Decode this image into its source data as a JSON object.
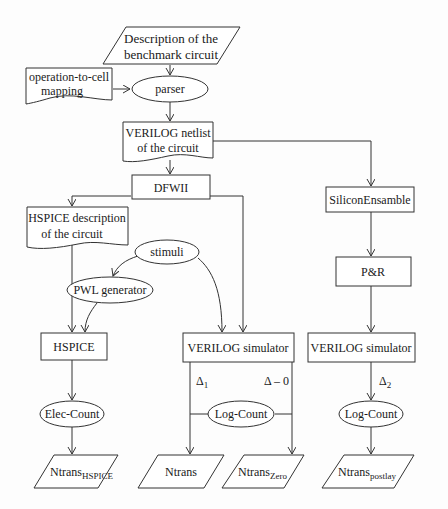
{
  "diagram": {
    "nodes": {
      "description": {
        "line1": "Description of the",
        "line2": "benchmark circuit",
        "shape": "parallelogram"
      },
      "mapping": {
        "line1": "operation-to-cell",
        "line2": "mapping",
        "shape": "document"
      },
      "parser": {
        "label": "parser",
        "shape": "ellipse"
      },
      "netlist": {
        "line1": "VERILOG netlist",
        "line2": "of the circuit",
        "shape": "document"
      },
      "dfwii": {
        "label": "DFWII",
        "shape": "rectangle"
      },
      "hspice_desc": {
        "line1": "HSPICE description",
        "line2": "of the circuit",
        "shape": "document"
      },
      "stimuli": {
        "label": "stimuli",
        "shape": "ellipse"
      },
      "pwl": {
        "label": "PWL generator",
        "shape": "ellipse"
      },
      "hspice": {
        "label": "HSPICE",
        "shape": "rectangle"
      },
      "verilog_sim_mid": {
        "label": "VERILOG simulator",
        "shape": "rectangle"
      },
      "silicon": {
        "label": "SiliconEnsamble",
        "shape": "rectangle"
      },
      "pr": {
        "label": "P&R",
        "shape": "rectangle"
      },
      "verilog_sim_right": {
        "label": "VERILOG simulator",
        "shape": "rectangle"
      },
      "elec_count": {
        "label": "Elec-Count",
        "shape": "ellipse"
      },
      "log_count_mid": {
        "label": "Log-Count",
        "shape": "ellipse"
      },
      "log_count_right": {
        "label": "Log-Count",
        "shape": "ellipse"
      },
      "out_hspice": {
        "base": "Ntrans",
        "sub": "HSPICE",
        "shape": "parallelogram"
      },
      "out_ntrans": {
        "base": "Ntrans",
        "sub": "",
        "shape": "parallelogram"
      },
      "out_zero": {
        "base": "Ntrans",
        "sub": "Zero",
        "shape": "parallelogram"
      },
      "out_postlay": {
        "base": "Ntrans",
        "sub": "postlay",
        "shape": "parallelogram"
      }
    },
    "edge_labels": {
      "delta1": {
        "base": "Δ",
        "sub": "1"
      },
      "delta0": {
        "text": "Δ – 0"
      },
      "delta2": {
        "base": "Δ",
        "sub": "2"
      }
    },
    "edges": [
      [
        "description",
        "parser"
      ],
      [
        "mapping",
        "parser"
      ],
      [
        "parser",
        "netlist"
      ],
      [
        "netlist",
        "dfwii"
      ],
      [
        "netlist",
        "silicon"
      ],
      [
        "dfwii",
        "hspice_desc"
      ],
      [
        "dfwii",
        "verilog_sim_mid"
      ],
      [
        "hspice_desc",
        "hspice"
      ],
      [
        "stimuli",
        "pwl"
      ],
      [
        "stimuli",
        "verilog_sim_mid"
      ],
      [
        "pwl",
        "hspice"
      ],
      [
        "silicon",
        "pr"
      ],
      [
        "pr",
        "verilog_sim_right"
      ],
      [
        "hspice",
        "elec_count"
      ],
      [
        "elec_count",
        "out_hspice"
      ],
      [
        "verilog_sim_mid",
        "out_ntrans",
        "delta1"
      ],
      [
        "verilog_sim_mid",
        "out_zero",
        "delta0"
      ],
      [
        "log_count_mid",
        "out_ntrans"
      ],
      [
        "log_count_mid",
        "out_zero"
      ],
      [
        "verilog_sim_right",
        "log_count_right",
        "delta2"
      ],
      [
        "log_count_right",
        "out_postlay"
      ]
    ]
  }
}
